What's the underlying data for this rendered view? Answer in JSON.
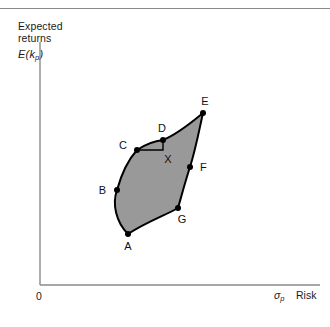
{
  "figure": {
    "background_color": "#ffffff",
    "rule_color": "#8a8a8a"
  },
  "axes": {
    "y_title": "Expected\nreturns",
    "y_symbol_main": "E(k",
    "y_symbol_sub": "p",
    "y_symbol_close": ")",
    "x_symbol_main": "σ",
    "x_symbol_sub": "p",
    "x_title": "Risk",
    "origin": "0",
    "axis_color": "#8a8a8a"
  },
  "chart_data": {
    "type": "scatter",
    "title": "",
    "subtitle": "",
    "xlabel": "σp Risk",
    "ylabel": "E(kp) Expected returns",
    "xlim": [
      0,
      1
    ],
    "ylim": [
      0,
      1
    ],
    "grid": false,
    "legend": null,
    "region": {
      "name": "feasible-set",
      "fill_color": "#999999",
      "stroke_color": "#000000",
      "stroke_width": 2.0
    },
    "points": [
      {
        "label": "A",
        "x": 0.305,
        "y": 0.215,
        "px": 128,
        "py": 234,
        "label_dx": 0,
        "label_dy": 16,
        "label_anchor": "middle"
      },
      {
        "label": "B",
        "x": 0.265,
        "y": 0.363,
        "px": 117,
        "py": 190,
        "label_dx": -11,
        "label_dy": 4,
        "label_anchor": "end"
      },
      {
        "label": "C",
        "x": 0.338,
        "y": 0.497,
        "px": 137,
        "py": 150,
        "label_dx": -10,
        "label_dy": -1,
        "label_anchor": "end"
      },
      {
        "label": "D",
        "x": 0.428,
        "y": 0.531,
        "px": 163,
        "py": 140,
        "label_dx": -1,
        "label_dy": -8,
        "label_anchor": "middle"
      },
      {
        "label": "E",
        "x": 0.697,
        "y": 0.641,
        "px": 203,
        "py": 113,
        "label_dx": 2,
        "label_dy": -8,
        "label_anchor": "middle"
      },
      {
        "label": "F",
        "x": 0.655,
        "y": 0.457,
        "px": 190,
        "py": 167,
        "label_dx": 10,
        "label_dy": 4,
        "label_anchor": "start"
      },
      {
        "label": "G",
        "x": 0.58,
        "y": 0.32,
        "px": 178,
        "py": 208,
        "label_dx": 4,
        "label_dy": 15,
        "label_anchor": "middle"
      },
      {
        "label": "X",
        "x": 0.428,
        "y": 0.497,
        "px": 163,
        "py": 150,
        "label_dx": 5,
        "label_dy": 13,
        "label_anchor": "middle",
        "marker": false
      }
    ],
    "boundary_path": "M 128 234 C 116 222 112 204 117 190 C 122 172 128 160 137 150 C 146 144 154 141 163 140 C 178 134 192 122 203 113 C 200 126 196 148 190 167 C 186 179 182 194 178 208 C 166 215 146 222 128 234 Z",
    "construction_triangle": {
      "name": "triangle-CDX",
      "path": "M 137 150 L 163 150 L 163 140",
      "stroke_color": "#000000",
      "stroke_width": 1.4,
      "vertices": [
        "C",
        "X",
        "D"
      ]
    }
  }
}
